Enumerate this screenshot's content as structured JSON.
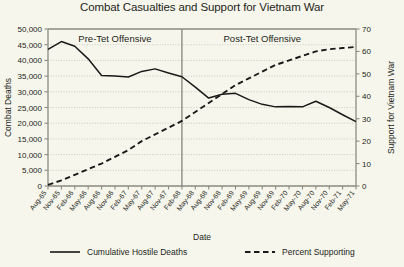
{
  "chart_data": {
    "type": "line",
    "title": "Combat Casualties and Support for Vietnam War",
    "xlabel": "Date",
    "ylabel": "Combat Deaths",
    "y2label": "Support for Vietnam War",
    "grid": true,
    "legend_position": "bottom",
    "ylim": [
      0,
      50000
    ],
    "y2lim": [
      0,
      70
    ],
    "ytick_labels": [
      "0",
      "5,000",
      "10,000",
      "15,000",
      "20,000",
      "25,000",
      "30,000",
      "35,000",
      "40,000",
      "45,000",
      "50,000"
    ],
    "ytick_values": [
      0,
      5000,
      10000,
      15000,
      20000,
      25000,
      30000,
      35000,
      40000,
      45000,
      50000
    ],
    "y2tick_labels": [
      "0",
      "10",
      "20",
      "30",
      "40",
      "50",
      "60",
      "70"
    ],
    "y2tick_values": [
      0,
      10,
      20,
      30,
      40,
      50,
      60,
      70
    ],
    "categories": [
      "Aug-65",
      "Nov-65",
      "Feb-66",
      "May-66",
      "Aug-66",
      "Nov-66",
      "Feb-67",
      "May-67",
      "Aug-67",
      "Nov-67",
      "Feb-68",
      "May-68",
      "Aug-68",
      "Nov-68",
      "Feb-69",
      "May-69",
      "Aug-69",
      "Nov-69",
      "Feb-70",
      "May-70",
      "Aug-70",
      "Nov-70",
      "Feb-71",
      "May-71"
    ],
    "series": [
      {
        "name": "Cumulative Hostile Deaths",
        "axis": "left",
        "style": "solid",
        "values": [
          43500,
          46000,
          44500,
          40500,
          35200,
          35000,
          34700,
          36500,
          37300,
          36000,
          34800,
          31500,
          28000,
          29200,
          29500,
          27500,
          26000,
          25200,
          25300,
          25200,
          27000,
          25000,
          22700,
          20500
        ]
      },
      {
        "name": "Percent Supporting",
        "axis": "right",
        "style": "dashed",
        "values": [
          0.5,
          2.5,
          5,
          7.5,
          10,
          13,
          16,
          20,
          23,
          26,
          29,
          33,
          37,
          41,
          45,
          48,
          51,
          54,
          56,
          58,
          60,
          61,
          61.5,
          62
        ]
      }
    ],
    "annotations": [
      {
        "name": "pre-tet-offensive",
        "label": "Pre-Tet Offensive",
        "at_category_index": 5
      },
      {
        "name": "post-tet-offensive",
        "label": "Post-Tet Offensive",
        "at_category_index": 16
      }
    ],
    "divider": {
      "name": "tet-offensive-divider",
      "at_category": "Feb-68",
      "at_category_index": 10
    }
  },
  "legend": {
    "items": [
      {
        "label": "Cumulative Hostile Deaths",
        "style": "solid"
      },
      {
        "label": "Percent Supporting",
        "style": "dashed"
      }
    ]
  },
  "colors": {
    "background": "#f7f6ec",
    "line": "#1a1a1a",
    "axis": "#8c8c82",
    "grid": "#b9b9ab",
    "text": "#231f20"
  }
}
